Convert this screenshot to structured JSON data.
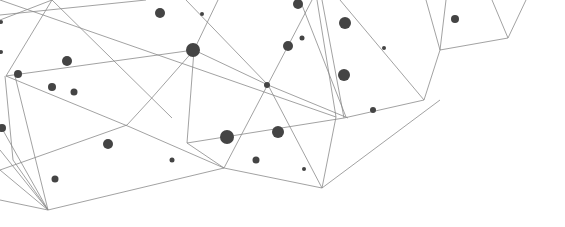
{
  "graphic": {
    "width": 565,
    "height": 227,
    "background": "#ffffff",
    "line_color": "#8a8a8a",
    "node_color": "#444444",
    "lines": [
      [
        0,
        20,
        52,
        0
      ],
      [
        52,
        0,
        172,
        118
      ],
      [
        6,
        76,
        194,
        50
      ],
      [
        6,
        76,
        130,
        127
      ],
      [
        6,
        76,
        52,
        0
      ],
      [
        5,
        76,
        13,
        160
      ],
      [
        13,
        160,
        48,
        210
      ],
      [
        0,
        125,
        48,
        210
      ],
      [
        0,
        150,
        48,
        210
      ],
      [
        0,
        170,
        48,
        210
      ],
      [
        15,
        76,
        48,
        210
      ],
      [
        0,
        200,
        48,
        210
      ],
      [
        48,
        210,
        224,
        168
      ],
      [
        0,
        170,
        127,
        125
      ],
      [
        127,
        125,
        150,
        100
      ],
      [
        130,
        127,
        224,
        168
      ],
      [
        150,
        100,
        194,
        50
      ],
      [
        194,
        50,
        187,
        143
      ],
      [
        187,
        143,
        224,
        168
      ],
      [
        194,
        50,
        268,
        85
      ],
      [
        224,
        168,
        288,
        46
      ],
      [
        288,
        46,
        312,
        0
      ],
      [
        268,
        85,
        322,
        188
      ],
      [
        224,
        168,
        322,
        188
      ],
      [
        322,
        188,
        336,
        117
      ],
      [
        336,
        117,
        317,
        0
      ],
      [
        268,
        85,
        186,
        0
      ],
      [
        194,
        50,
        218,
        0
      ],
      [
        187,
        143,
        344,
        118
      ],
      [
        344,
        118,
        424,
        100
      ],
      [
        424,
        100,
        440,
        50
      ],
      [
        440,
        50,
        426,
        0
      ],
      [
        440,
        50,
        446,
        0
      ],
      [
        440,
        50,
        508,
        38
      ],
      [
        508,
        38,
        492,
        0
      ],
      [
        508,
        38,
        526,
        0
      ],
      [
        322,
        188,
        440,
        100
      ],
      [
        344,
        118,
        322,
        0
      ],
      [
        300,
        0,
        346,
        117
      ],
      [
        268,
        85,
        348,
        118
      ],
      [
        424,
        100,
        340,
        0
      ],
      [
        0,
        15,
        146,
        0
      ],
      [
        336,
        117,
        0,
        0
      ]
    ],
    "nodes": [
      [
        160,
        13,
        5
      ],
      [
        202,
        14,
        2
      ],
      [
        298,
        4,
        5
      ],
      [
        345,
        23,
        6
      ],
      [
        302,
        38,
        2.5
      ],
      [
        384,
        48,
        2
      ],
      [
        455,
        19,
        4
      ],
      [
        193,
        50,
        7
      ],
      [
        288,
        46,
        5
      ],
      [
        344,
        75,
        6
      ],
      [
        267,
        85,
        3
      ],
      [
        373,
        110,
        3
      ],
      [
        18,
        74,
        4
      ],
      [
        67,
        61,
        5
      ],
      [
        52,
        87,
        4
      ],
      [
        74,
        92,
        3.5
      ],
      [
        278,
        132,
        6
      ],
      [
        227,
        137,
        7
      ],
      [
        108,
        144,
        5
      ],
      [
        256,
        160,
        3.5
      ],
      [
        172,
        160,
        2.5
      ],
      [
        304,
        169,
        2
      ],
      [
        55,
        179,
        3.5
      ],
      [
        2,
        128,
        4
      ],
      [
        1,
        22,
        2
      ],
      [
        1,
        52,
        2
      ]
    ]
  }
}
